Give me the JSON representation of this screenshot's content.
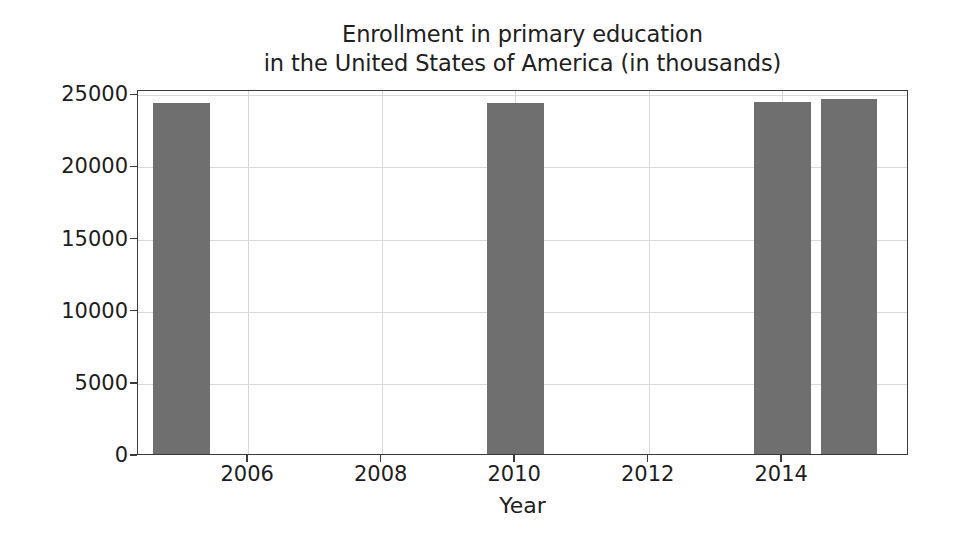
{
  "chart_data": {
    "type": "bar",
    "title": "Enrollment in primary education\nin the United States of America (in thousands)",
    "title_line1": "Enrollment in primary education",
    "title_line2": "in the United States of America (in thousands)",
    "xlabel": "Year",
    "ylabel": "",
    "x": [
      2005,
      2010,
      2014,
      2015
    ],
    "categories": [
      "2005",
      "2010",
      "2014",
      "2015"
    ],
    "values": [
      24300,
      24300,
      24400,
      24600
    ],
    "bar_width_years": 0.85,
    "xlim": [
      2004.35,
      2015.9
    ],
    "ylim": [
      0,
      25300
    ],
    "xticks": [
      2006,
      2008,
      2010,
      2012,
      2014
    ],
    "xtick_labels": [
      "2006",
      "2008",
      "2010",
      "2012",
      "2014"
    ],
    "yticks": [
      0,
      5000,
      10000,
      15000,
      20000,
      25000
    ],
    "ytick_labels": [
      "0",
      "5000",
      "10000",
      "15000",
      "20000",
      "25000"
    ],
    "grid": true,
    "legend": false,
    "legend_position": "none",
    "bar_color": "#6f6f6f",
    "grid_color": "#d8d8d8",
    "axis_color": "#3a3a3a",
    "background_color": "#ffffff"
  }
}
